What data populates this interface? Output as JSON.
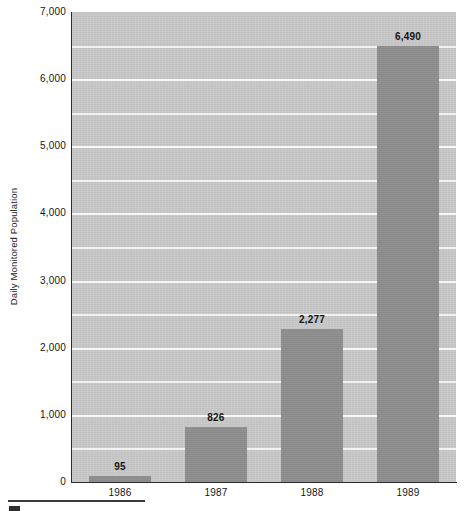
{
  "chart_data": {
    "type": "bar",
    "title": "",
    "xlabel": "",
    "ylabel": "Daily Monitored Population",
    "categories": [
      "1986",
      "1987",
      "1988",
      "1989"
    ],
    "values": [
      95,
      826,
      2277,
      6490
    ],
    "value_labels": [
      "95",
      "826",
      "2,277",
      "6,490"
    ],
    "ylim": [
      0,
      7000
    ],
    "y_major_ticks": [
      0,
      1000,
      2000,
      3000,
      4000,
      5000,
      6000,
      7000
    ],
    "y_tick_labels": [
      "0",
      "1,000",
      "2,000",
      "3,000",
      "4,000",
      "5,000",
      "6,000",
      "7,000"
    ],
    "y_minor_tick_interval": 500,
    "grid": true,
    "grid_axis": "y",
    "grid_color": "#f4f4f4",
    "legend": false,
    "bar_color": "#8e8e8e",
    "plot_background": "#c9c9c9",
    "page_background": "#ffffff"
  },
  "axes": {
    "y_title": "Daily Monitored Population"
  },
  "footer": {
    "rule_present": true,
    "mark_present": true
  }
}
